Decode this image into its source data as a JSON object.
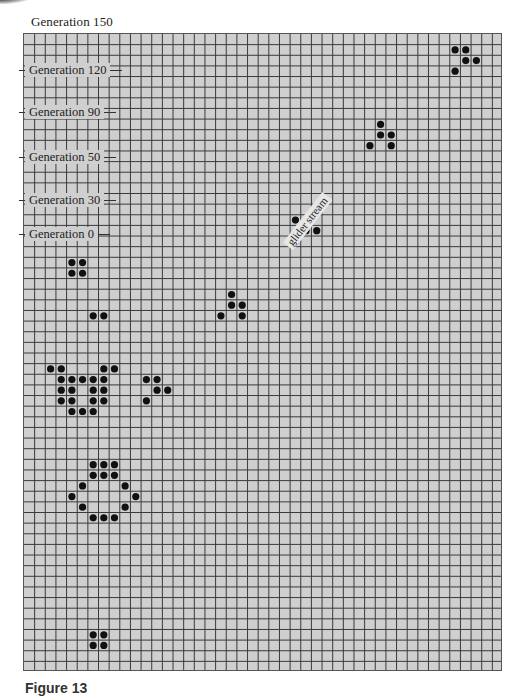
{
  "figure": {
    "top_title": "Generation 150",
    "caption": "Figure 13",
    "grid": {
      "columns": 45,
      "rows": 60,
      "cell_fill": "#cfcfcf",
      "line_color": "#3a3a3a",
      "dot_color": "#111111"
    },
    "generation_labels": [
      {
        "text": "Generation 120",
        "y": 70
      },
      {
        "text": "Generation 90",
        "y": 112
      },
      {
        "text": "Generation 50",
        "y": 157
      },
      {
        "text": "Generation 30",
        "y": 200
      },
      {
        "text": "Generation 0",
        "y": 234
      }
    ],
    "annotation": {
      "text": "glider stream"
    },
    "patterns": [
      {
        "name": "glider-top-right",
        "cells": [
          [
            1,
            40
          ],
          [
            1,
            41
          ],
          [
            2,
            41
          ],
          [
            2,
            42
          ],
          [
            3,
            40
          ]
        ]
      },
      {
        "name": "glider-upper",
        "cells": [
          [
            8,
            33
          ],
          [
            9,
            33
          ],
          [
            9,
            34
          ],
          [
            10,
            32
          ],
          [
            10,
            34
          ]
        ]
      },
      {
        "name": "glider-middle",
        "cells": [
          [
            17,
            25
          ],
          [
            17,
            26
          ],
          [
            18,
            26
          ],
          [
            18,
            27
          ],
          [
            19,
            25
          ]
        ]
      },
      {
        "name": "block-left",
        "cells": [
          [
            21,
            4
          ],
          [
            21,
            5
          ],
          [
            22,
            4
          ],
          [
            22,
            5
          ]
        ]
      },
      {
        "name": "glider-lower",
        "cells": [
          [
            24,
            19
          ],
          [
            25,
            19
          ],
          [
            25,
            20
          ],
          [
            26,
            18
          ],
          [
            26,
            20
          ]
        ]
      },
      {
        "name": "pair-left",
        "cells": [
          [
            26,
            6
          ],
          [
            26,
            7
          ]
        ]
      },
      {
        "name": "gun-cluster",
        "cells": [
          [
            31,
            2
          ],
          [
            31,
            3
          ],
          [
            31,
            7
          ],
          [
            31,
            8
          ],
          [
            32,
            3
          ],
          [
            32,
            4
          ],
          [
            32,
            5
          ],
          [
            32,
            6
          ],
          [
            32,
            7
          ],
          [
            33,
            3
          ],
          [
            33,
            4
          ],
          [
            33,
            6
          ],
          [
            33,
            7
          ],
          [
            34,
            3
          ],
          [
            34,
            4
          ],
          [
            34,
            6
          ],
          [
            34,
            7
          ],
          [
            35,
            4
          ],
          [
            35,
            5
          ],
          [
            35,
            6
          ]
        ]
      },
      {
        "name": "glider-cluster",
        "cells": [
          [
            32,
            11
          ],
          [
            32,
            12
          ],
          [
            33,
            12
          ],
          [
            33,
            13
          ],
          [
            34,
            11
          ]
        ]
      },
      {
        "name": "oval",
        "cells": [
          [
            40,
            6
          ],
          [
            40,
            7
          ],
          [
            40,
            8
          ],
          [
            41,
            6
          ],
          [
            41,
            7
          ],
          [
            41,
            8
          ],
          [
            42,
            5
          ],
          [
            42,
            9
          ],
          [
            43,
            4
          ],
          [
            43,
            10
          ],
          [
            44,
            5
          ],
          [
            44,
            9
          ],
          [
            45,
            6
          ],
          [
            45,
            7
          ],
          [
            45,
            8
          ]
        ]
      },
      {
        "name": "block-bottom",
        "cells": [
          [
            56,
            6
          ],
          [
            56,
            7
          ],
          [
            57,
            6
          ],
          [
            57,
            7
          ]
        ]
      }
    ]
  }
}
